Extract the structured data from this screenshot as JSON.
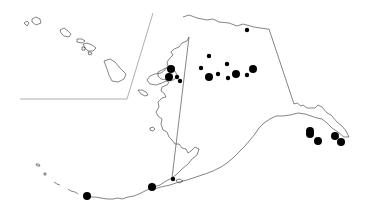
{
  "map": {
    "title": "",
    "regions": [
      "Hawaii (inset)",
      "Alaska"
    ],
    "colors": {
      "background": "#ffffff",
      "outline": "#333333",
      "marker": "#000000"
    },
    "markers": [
      {
        "x": 247,
        "y": 30,
        "r": 2.2
      },
      {
        "x": 209,
        "y": 56,
        "r": 2.2
      },
      {
        "x": 227,
        "y": 64,
        "r": 2.2
      },
      {
        "x": 201,
        "y": 68,
        "r": 2.2
      },
      {
        "x": 253,
        "y": 69,
        "r": 4
      },
      {
        "x": 171,
        "y": 69,
        "r": 4
      },
      {
        "x": 169,
        "y": 77,
        "r": 4
      },
      {
        "x": 177,
        "y": 77,
        "r": 2.2
      },
      {
        "x": 180,
        "y": 81,
        "r": 2.2
      },
      {
        "x": 209,
        "y": 77,
        "r": 4
      },
      {
        "x": 218,
        "y": 74,
        "r": 2.2
      },
      {
        "x": 228,
        "y": 78,
        "r": 2.2
      },
      {
        "x": 236,
        "y": 74,
        "r": 4
      },
      {
        "x": 247,
        "y": 75,
        "r": 2.2
      },
      {
        "x": 310,
        "y": 131,
        "r": 4
      },
      {
        "x": 310,
        "y": 134,
        "r": 4
      },
      {
        "x": 318,
        "y": 141,
        "r": 4
      },
      {
        "x": 335,
        "y": 136,
        "r": 4
      },
      {
        "x": 341,
        "y": 142,
        "r": 4
      },
      {
        "x": 87,
        "y": 196,
        "r": 4
      },
      {
        "x": 152,
        "y": 187,
        "r": 4
      },
      {
        "x": 173,
        "y": 179,
        "r": 2.2
      }
    ]
  }
}
